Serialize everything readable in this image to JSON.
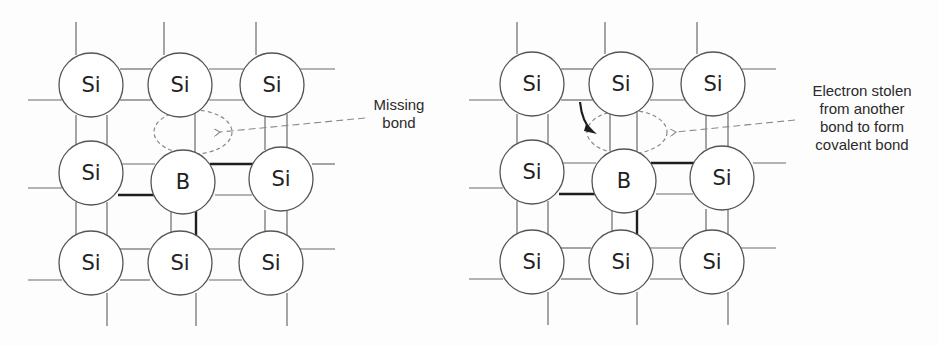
{
  "colors": {
    "line": "#6b6b6b",
    "bold": "#1e1e1e",
    "dash": "#8a8a8a",
    "circle_stroke": "#555555",
    "circle_fill": "#ffffff",
    "text": "#222222"
  },
  "panels": [
    {
      "id": "left",
      "offset_x": 0,
      "atoms": [
        {
          "label": "Si",
          "cx": 91,
          "cy": 85
        },
        {
          "label": "Si",
          "cx": 180,
          "cy": 85
        },
        {
          "label": "Si",
          "cx": 272,
          "cy": 85
        },
        {
          "label": "Si",
          "cx": 91,
          "cy": 173
        },
        {
          "label": "B",
          "cx": 183,
          "cy": 182
        },
        {
          "label": "Si",
          "cx": 281,
          "cy": 179
        },
        {
          "label": "Si",
          "cx": 91,
          "cy": 263
        },
        {
          "label": "Si",
          "cx": 180,
          "cy": 263
        },
        {
          "label": "Si",
          "cx": 271,
          "cy": 263
        }
      ],
      "lines": [
        [
          76,
          22,
          76,
          55
        ],
        [
          164,
          22,
          164,
          55
        ],
        [
          256,
          22,
          256,
          55
        ],
        [
          28,
          100,
          62,
          100
        ],
        [
          300,
          69,
          335,
          69
        ],
        [
          120,
          69,
          152,
          69
        ],
        [
          120,
          100,
          152,
          100
        ],
        [
          209,
          69,
          244,
          69
        ],
        [
          209,
          100,
          244,
          100
        ],
        [
          76,
          115,
          76,
          145
        ],
        [
          107,
          115,
          107,
          145
        ],
        [
          195,
          112,
          195,
          152
        ],
        [
          265,
          114,
          265,
          150
        ],
        [
          287,
          114,
          287,
          150
        ],
        [
          28,
          188,
          62,
          188
        ],
        [
          118,
          164,
          155,
          164
        ],
        [
          312,
          164,
          335,
          164
        ],
        [
          215,
          195,
          252,
          195
        ],
        [
          76,
          202,
          76,
          235
        ],
        [
          107,
          202,
          107,
          235
        ],
        [
          171,
          208,
          171,
          234
        ],
        [
          265,
          210,
          265,
          236
        ],
        [
          287,
          210,
          287,
          236
        ],
        [
          120,
          249,
          150,
          249
        ],
        [
          120,
          280,
          150,
          280
        ],
        [
          209,
          249,
          242,
          249
        ],
        [
          209,
          280,
          242,
          280
        ],
        [
          300,
          249,
          335,
          249
        ],
        [
          28,
          280,
          62,
          280
        ],
        [
          107,
          293,
          107,
          326
        ],
        [
          196,
          293,
          196,
          326
        ],
        [
          287,
          293,
          287,
          326
        ]
      ],
      "bold_lines": [
        [
          118,
          195,
          155,
          195
        ],
        [
          210,
          164,
          256,
          164
        ],
        [
          196,
          208,
          196,
          236
        ]
      ],
      "ellipse": {
        "cx": 193,
        "cy": 132,
        "rx": 39,
        "ry": 22
      },
      "dash_arrow": {
        "x1": 365,
        "y1": 118,
        "x2": 220,
        "y2": 132
      },
      "curved_arrow": null
    },
    {
      "id": "right",
      "offset_x": 0,
      "atoms": [
        {
          "label": "Si",
          "cx": 532,
          "cy": 84
        },
        {
          "label": "Si",
          "cx": 621,
          "cy": 84
        },
        {
          "label": "Si",
          "cx": 713,
          "cy": 84
        },
        {
          "label": "Si",
          "cx": 532,
          "cy": 172
        },
        {
          "label": "B",
          "cx": 624,
          "cy": 181
        },
        {
          "label": "Si",
          "cx": 722,
          "cy": 178
        },
        {
          "label": "Si",
          "cx": 532,
          "cy": 262
        },
        {
          "label": "Si",
          "cx": 621,
          "cy": 262
        },
        {
          "label": "Si",
          "cx": 712,
          "cy": 262
        }
      ],
      "lines": [
        [
          517,
          22,
          517,
          54
        ],
        [
          605,
          22,
          605,
          54
        ],
        [
          697,
          22,
          697,
          54
        ],
        [
          469,
          100,
          503,
          100
        ],
        [
          741,
          69,
          776,
          69
        ],
        [
          561,
          69,
          593,
          69
        ],
        [
          561,
          100,
          593,
          100
        ],
        [
          650,
          69,
          685,
          69
        ],
        [
          650,
          100,
          685,
          100
        ],
        [
          517,
          114,
          517,
          144
        ],
        [
          548,
          114,
          548,
          144
        ],
        [
          610,
          112,
          610,
          151
        ],
        [
          637,
          112,
          637,
          151
        ],
        [
          706,
          113,
          706,
          149
        ],
        [
          728,
          113,
          728,
          149
        ],
        [
          469,
          188,
          503,
          188
        ],
        [
          559,
          163,
          596,
          163
        ],
        [
          753,
          163,
          786,
          163
        ],
        [
          656,
          194,
          693,
          194
        ],
        [
          517,
          201,
          517,
          234
        ],
        [
          548,
          201,
          548,
          234
        ],
        [
          612,
          207,
          612,
          233
        ],
        [
          706,
          209,
          706,
          235
        ],
        [
          728,
          209,
          728,
          235
        ],
        [
          561,
          248,
          591,
          248
        ],
        [
          561,
          279,
          591,
          279
        ],
        [
          650,
          248,
          683,
          248
        ],
        [
          650,
          279,
          683,
          279
        ],
        [
          741,
          248,
          776,
          248
        ],
        [
          469,
          279,
          503,
          279
        ],
        [
          548,
          292,
          548,
          325
        ],
        [
          637,
          292,
          637,
          325
        ],
        [
          728,
          292,
          728,
          325
        ]
      ],
      "bold_lines": [
        [
          559,
          194,
          596,
          194
        ],
        [
          651,
          163,
          697,
          163
        ],
        [
          637,
          207,
          637,
          235
        ]
      ],
      "ellipse": {
        "cx": 627,
        "cy": 132,
        "rx": 40,
        "ry": 22
      },
      "dash_arrow": {
        "x1": 795,
        "y1": 120,
        "x2": 676,
        "y2": 132
      },
      "curved_arrow": {
        "path": "M580,102 Q582,122 592,131",
        "head": "586,124 597,134 584,131"
      }
    }
  ],
  "labels": [
    {
      "id": "missing-bond",
      "lines": [
        "Missing",
        "bond"
      ],
      "x": 362,
      "y": 96,
      "w": 74
    },
    {
      "id": "electron-stolen",
      "lines": [
        "Electron stolen",
        "from another",
        "bond to form",
        "covalent bond"
      ],
      "x": 792,
      "y": 82,
      "w": 140
    }
  ]
}
